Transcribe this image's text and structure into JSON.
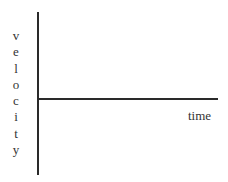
{
  "diagram": {
    "type": "axes",
    "y_axis": {
      "label": "velocity",
      "letters": [
        "v",
        "e",
        "l",
        "o",
        "c",
        "i",
        "t",
        "y"
      ]
    },
    "x_axis": {
      "label": "time"
    },
    "colors": {
      "axis": "#2a2a2a",
      "text": "#333333",
      "background": "#ffffff"
    }
  }
}
